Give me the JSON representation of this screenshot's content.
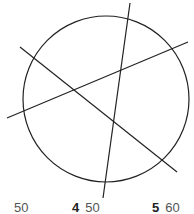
{
  "diagram": {
    "stroke_color": "#222222",
    "circle": {
      "cx": 106,
      "cy": 99,
      "r": 83
    },
    "lines": [
      {
        "name": "steep-line",
        "x1": 130,
        "y1": 3,
        "x2": 103,
        "y2": 198
      },
      {
        "name": "shallow-line",
        "x1": 7,
        "y1": 118,
        "x2": 188,
        "y2": 42
      },
      {
        "name": "diagonal-line",
        "x1": 20,
        "y1": 47,
        "x2": 177,
        "y2": 172
      }
    ]
  },
  "footer": {
    "items": [
      {
        "number": "",
        "value": "50"
      },
      {
        "number": "4",
        "value": "50"
      },
      {
        "number": "5",
        "value": "60"
      }
    ]
  }
}
